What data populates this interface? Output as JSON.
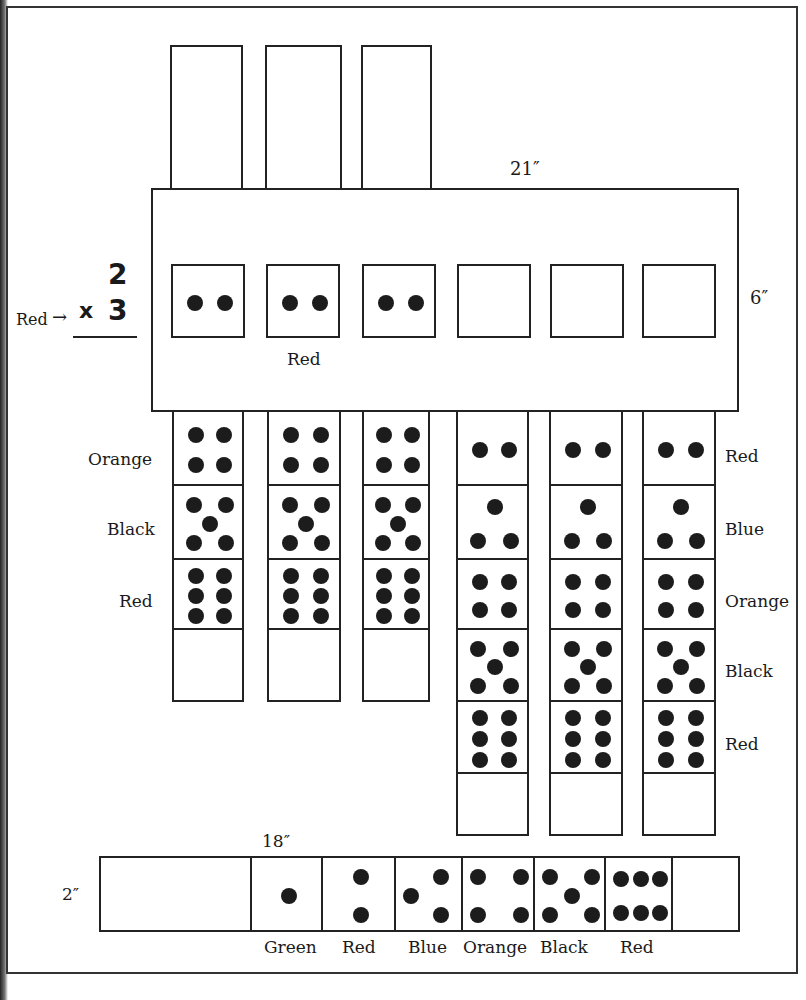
{
  "dimensions": {
    "main_width": "21″",
    "main_height": "6″",
    "strip_width": "18″",
    "strip_height": "2″"
  },
  "equation": {
    "top": "2",
    "bottom": "3",
    "operator": "x",
    "pointer_label": "Red",
    "arrow": "→"
  },
  "main_board": {
    "squares_label": "Red",
    "squares": [
      2,
      2,
      2,
      0,
      0,
      0
    ]
  },
  "left_columns": {
    "row_labels": [
      "Orange",
      "Black",
      "Red"
    ],
    "cells": [
      4,
      5,
      6,
      0
    ]
  },
  "right_columns": {
    "row_labels": [
      "Red",
      "Blue",
      "Orange",
      "Black",
      "Red"
    ],
    "cells": [
      2,
      3,
      4,
      5,
      6,
      0
    ]
  },
  "bottom_strip": {
    "labels": [
      "Green",
      "Red",
      "Blue",
      "Orange",
      "Black",
      "Red"
    ],
    "cells": [
      1,
      2,
      3,
      4,
      5,
      6
    ]
  }
}
